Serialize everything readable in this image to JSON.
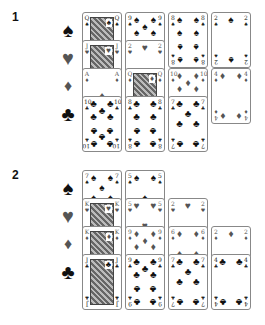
{
  "sections": [
    {
      "label": "1",
      "suits": [
        {
          "symbol": "♠",
          "name": "spades",
          "color": "black"
        },
        {
          "symbol": "♥",
          "name": "hearts",
          "color": "red"
        },
        {
          "symbol": "♦",
          "name": "diamonds",
          "color": "red"
        },
        {
          "symbol": "♣",
          "name": "clubs",
          "color": "black"
        }
      ],
      "cards": [
        {
          "rank": "Q",
          "suit": "♠",
          "col": 0,
          "row": 0,
          "face": true
        },
        {
          "rank": "J",
          "suit": "♥",
          "col": 0,
          "row": 1,
          "face": true
        },
        {
          "rank": "A",
          "suit": "♦",
          "col": 0,
          "row": 2
        },
        {
          "rank": "10",
          "suit": "♣",
          "col": 0,
          "row": 3
        },
        {
          "rank": "9",
          "suit": "♠",
          "col": 1,
          "row": 0
        },
        {
          "rank": "2",
          "suit": "♥",
          "col": 1,
          "row": 1
        },
        {
          "rank": "Q",
          "suit": "♦",
          "col": 1,
          "row": 2,
          "face": true
        },
        {
          "rank": "8",
          "suit": "♣",
          "col": 1,
          "row": 3
        },
        {
          "rank": "8",
          "suit": "♠",
          "col": 2,
          "row": 0
        },
        {
          "rank": "10",
          "suit": "♦",
          "col": 2,
          "row": 2
        },
        {
          "rank": "7",
          "suit": "♣",
          "col": 2,
          "row": 3
        },
        {
          "rank": "2",
          "suit": "♠",
          "col": 3,
          "row": 0
        },
        {
          "rank": "4",
          "suit": "♦",
          "col": 3,
          "row": 2
        }
      ]
    },
    {
      "label": "2",
      "suits": [
        {
          "symbol": "♠",
          "name": "spades",
          "color": "black"
        },
        {
          "symbol": "♥",
          "name": "hearts",
          "color": "red"
        },
        {
          "symbol": "♦",
          "name": "diamonds",
          "color": "red"
        },
        {
          "symbol": "♣",
          "name": "clubs",
          "color": "black"
        }
      ],
      "cards": [
        {
          "rank": "7",
          "suit": "♠",
          "col": 0,
          "row": 0
        },
        {
          "rank": "K",
          "suit": "♥",
          "col": 0,
          "row": 1,
          "face": true
        },
        {
          "rank": "K",
          "suit": "♦",
          "col": 0,
          "row": 2,
          "face": true
        },
        {
          "rank": "J",
          "suit": "♣",
          "col": 0,
          "row": 3,
          "face": true
        },
        {
          "rank": "5",
          "suit": "♠",
          "col": 1,
          "row": 0
        },
        {
          "rank": "5",
          "suit": "♥",
          "col": 1,
          "row": 1
        },
        {
          "rank": "9",
          "suit": "♦",
          "col": 1,
          "row": 2
        },
        {
          "rank": "9",
          "suit": "♣",
          "col": 1,
          "row": 3
        },
        {
          "rank": "2",
          "suit": "♥",
          "col": 2,
          "row": 1
        },
        {
          "rank": "6",
          "suit": "♦",
          "col": 2,
          "row": 2
        },
        {
          "rank": "7",
          "suit": "♣",
          "col": 2,
          "row": 3
        },
        {
          "rank": "2",
          "suit": "♦",
          "col": 3,
          "row": 2
        },
        {
          "rank": "4",
          "suit": "♣",
          "col": 3,
          "row": 3
        }
      ]
    }
  ]
}
